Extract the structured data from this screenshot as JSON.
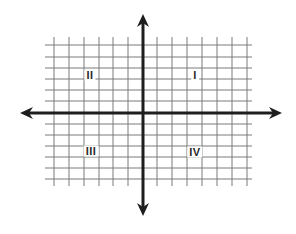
{
  "diagram": {
    "type": "coordinate-plane",
    "quadrants": [
      {
        "label": "I",
        "position": "top-right",
        "x": 195,
        "y": 75
      },
      {
        "label": "II",
        "position": "top-left",
        "x": 90,
        "y": 75
      },
      {
        "label": "III",
        "position": "bottom-left",
        "x": 91,
        "y": 151
      },
      {
        "label": "IV",
        "position": "bottom-right",
        "x": 195,
        "y": 152
      }
    ],
    "grid": {
      "vertical_lines_x": [
        54,
        69,
        84,
        99,
        113,
        128,
        157,
        172,
        187,
        202,
        217,
        232,
        247
      ],
      "horizontal_lines_y": [
        45,
        57,
        68,
        79,
        90,
        101,
        124,
        135,
        146,
        157,
        168,
        179
      ],
      "x_extent": [
        45,
        252
      ],
      "y_extent": [
        37,
        186
      ],
      "color": "#7a7a7a"
    },
    "axes": {
      "origin": {
        "x": 143,
        "y": 113
      },
      "x_axis": {
        "from": 20,
        "to": 282
      },
      "y_axis": {
        "from": 14,
        "to": 216
      },
      "color": "#1e1e1e"
    }
  }
}
